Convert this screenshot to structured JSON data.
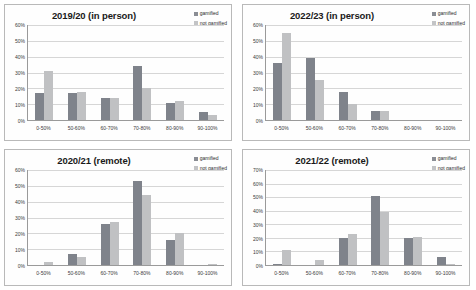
{
  "figure": {
    "legend_labels": [
      "gamified",
      "not gamified"
    ],
    "colors": {
      "gamified": "#7f838b",
      "not_gamified": "#c0c1c3",
      "gridline": "#d6d6d6",
      "axis": "#9a9a9a"
    }
  },
  "chart_data": [
    {
      "type": "bar",
      "title": "2019/20 (in person)",
      "xlabel": "",
      "ylabel": "",
      "categories": [
        "0-50%",
        "50-60%",
        "60-70%",
        "70-80%",
        "80-90%",
        "90-100%"
      ],
      "yticks": [
        "0%",
        "10%",
        "20%",
        "30%",
        "40%",
        "50%",
        "60%"
      ],
      "ytick_values": [
        0,
        10,
        20,
        30,
        40,
        50,
        60
      ],
      "ylim": [
        0,
        60
      ],
      "grid": true,
      "legend_position": "top-right",
      "series": [
        {
          "name": "gamified",
          "values": [
            17,
            17,
            14,
            34,
            11,
            5
          ]
        },
        {
          "name": "not gamified",
          "values": [
            31,
            18,
            14,
            20,
            12,
            3
          ]
        }
      ]
    },
    {
      "type": "bar",
      "title": "2022/23 (in person)",
      "xlabel": "",
      "ylabel": "",
      "categories": [
        "0-50%",
        "50-60%",
        "60-70%",
        "70-80%",
        "80-90%",
        "90-100%"
      ],
      "yticks": [
        "0%",
        "10%",
        "20%",
        "30%",
        "40%",
        "50%",
        "60%"
      ],
      "ytick_values": [
        0,
        10,
        20,
        30,
        40,
        50,
        60
      ],
      "ylim": [
        0,
        60
      ],
      "grid": true,
      "legend_position": "top-right",
      "series": [
        {
          "name": "gamified",
          "values": [
            36,
            39,
            18,
            6,
            0,
            0
          ]
        },
        {
          "name": "not gamified",
          "values": [
            55,
            25,
            10,
            6,
            0,
            0
          ]
        }
      ]
    },
    {
      "type": "bar",
      "title": "2020/21 (remote)",
      "xlabel": "",
      "ylabel": "",
      "categories": [
        "0-50%",
        "50-60%",
        "60-70%",
        "70-80%",
        "80-90%",
        "90-100%"
      ],
      "yticks": [
        "0%",
        "10%",
        "20%",
        "30%",
        "40%",
        "50%",
        "60%"
      ],
      "ytick_values": [
        0,
        10,
        20,
        30,
        40,
        50,
        60
      ],
      "ylim": [
        0,
        60
      ],
      "grid": true,
      "legend_position": "top-right",
      "series": [
        {
          "name": "gamified",
          "values": [
            0,
            7,
            26,
            53,
            16,
            0
          ]
        },
        {
          "name": "not gamified",
          "values": [
            2,
            5,
            27,
            44,
            20,
            0.5
          ]
        }
      ]
    },
    {
      "type": "bar",
      "title": "2021/22 (remote)",
      "xlabel": "",
      "ylabel": "",
      "categories": [
        "0-50%",
        "50-60%",
        "60-70%",
        "70-80%",
        "80-90%",
        "90-100%"
      ],
      "yticks": [
        "0%",
        "10%",
        "20%",
        "30%",
        "40%",
        "50%",
        "60%",
        "70%"
      ],
      "ytick_values": [
        0,
        10,
        20,
        30,
        40,
        50,
        60,
        70
      ],
      "ylim": [
        0,
        70
      ],
      "grid": true,
      "legend_position": "top-right",
      "series": [
        {
          "name": "gamified",
          "values": [
            1,
            0,
            20,
            51,
            20,
            6
          ]
        },
        {
          "name": "not gamified",
          "values": [
            11,
            4,
            23,
            39,
            21,
            1
          ]
        }
      ]
    }
  ]
}
